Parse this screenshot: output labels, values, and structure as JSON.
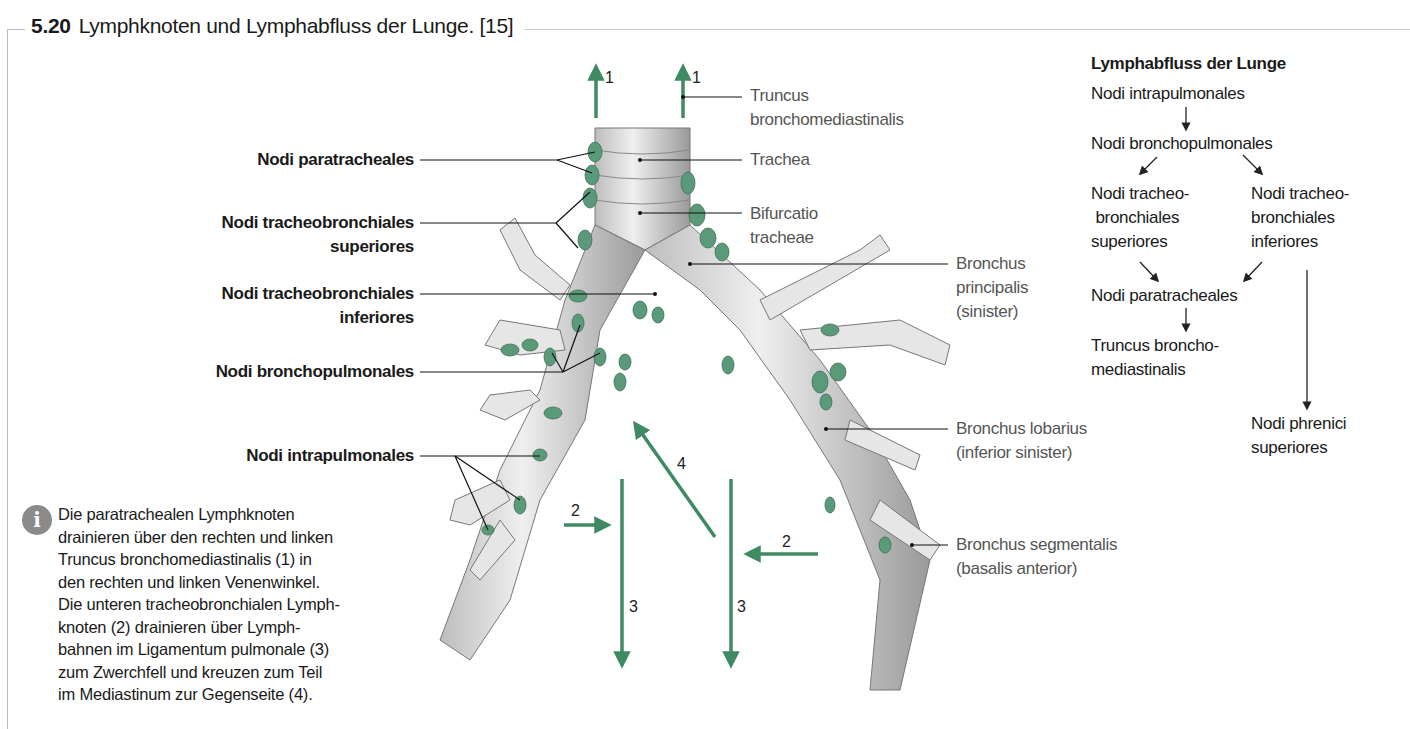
{
  "figure": {
    "number": "5.20",
    "title": "Lymphknoten und Lymphabfluss der Lunge. [15]"
  },
  "left_labels": [
    {
      "lines": [
        "Nodi paratracheales"
      ]
    },
    {
      "lines": [
        "Nodi tracheobronchiales",
        "superiores"
      ]
    },
    {
      "lines": [
        "Nodi tracheobronchiales",
        "inferiores"
      ]
    },
    {
      "lines": [
        "Nodi bronchopulmonales"
      ]
    },
    {
      "lines": [
        "Nodi intrapulmonales"
      ]
    }
  ],
  "right_labels": [
    {
      "lines": [
        "Truncus",
        "bronchomediastinalis"
      ]
    },
    {
      "lines": [
        "Trachea"
      ]
    },
    {
      "lines": [
        "Bifurcatio",
        "tracheae"
      ]
    },
    {
      "lines": [
        "Bronchus",
        "principalis",
        "(sinister)"
      ]
    },
    {
      "lines": [
        "Bronchus lobarius",
        "(inferior sinister)"
      ]
    },
    {
      "lines": [
        "Bronchus segmentalis",
        "(basalis anterior)"
      ]
    }
  ],
  "arrow_numbers": [
    "1",
    "1",
    "2",
    "2",
    "3",
    "3",
    "4"
  ],
  "flowchart": {
    "heading": "Lymphabfluss der Lunge",
    "nodes": {
      "intrapulmonales": "Nodi intrapulmonales",
      "bronchopulmonales": "Nodi bronchopulmonales",
      "tb_sup": [
        "Nodi tracheo-",
        "bronchiales",
        "superiores"
      ],
      "tb_inf": [
        "Nodi tracheo-",
        "bronchiales",
        "inferiores"
      ],
      "paratracheales": "Nodi paratracheales",
      "truncus": [
        "Truncus broncho-",
        "mediastinalis"
      ],
      "phrenici": [
        "Nodi phrenici",
        "superiores"
      ]
    }
  },
  "info_box": {
    "icon": "info-icon",
    "lines": [
      "Die paratrachealen Lymphknoten",
      "drainieren über den rechten und linken",
      "Truncus bronchomediastinalis (1) in",
      "den rechten und linken Venenwinkel.",
      "Die unteren tracheobronchialen Lymph-",
      "knoten (2) drainieren über Lymph-",
      "bahnen im Ligamentum pulmonale (3)",
      "zum Zwerchfell und kreuzen zum Teil",
      "im Mediastinum zur Gegenseite (4)."
    ]
  },
  "colors": {
    "arrow_green": "#3f8a62",
    "node_green": "#5a9a78",
    "frame_gray": "#bbbbbb",
    "label_gray": "#555555"
  }
}
